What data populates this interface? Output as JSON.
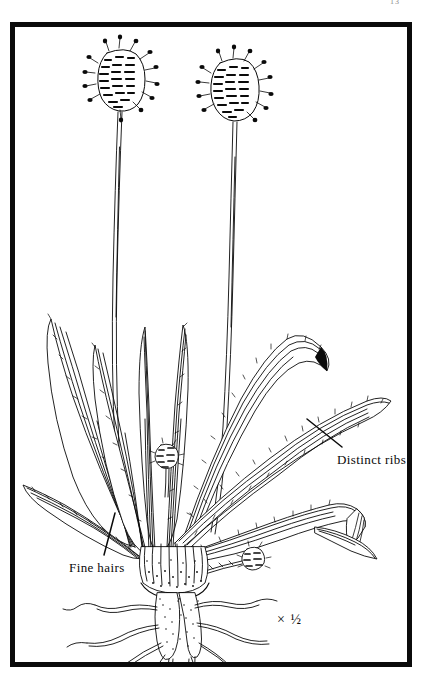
{
  "page": {
    "page_number": "13",
    "scale_note": "× ½"
  },
  "plate": {
    "subject": "Ribwort Plantain",
    "medium": "black-and-white pen line illustration",
    "background_color": "#ffffff",
    "ink_color": "#0a0a0a",
    "frame_color": "#0b0b0b"
  },
  "annotations": [
    {
      "id": "distinct-ribs",
      "label": "Distinct ribs",
      "leader": "line from label up-left to leaf surface"
    },
    {
      "id": "fine-hairs",
      "label": "Fine hairs",
      "leader": "line from label up-right to leaf margin"
    }
  ],
  "plant_parts": {
    "flower_spikes": 2,
    "flower_buds": 2,
    "scapes": 2,
    "leaves": 9,
    "root": "stippled taproot with fibrous lateral roots"
  }
}
